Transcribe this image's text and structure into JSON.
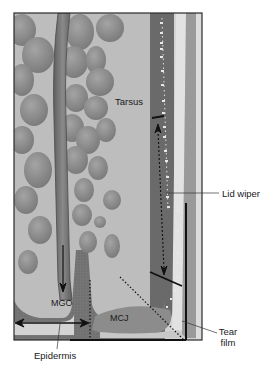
{
  "figure": {
    "type": "anatomical-diagram",
    "colors": {
      "background": "#ffffff",
      "tarsus_fill": "#bdbdbd",
      "gland_fill": "#8e8e8e",
      "duct_fill": "#7a7a7a",
      "conjunctiva_fill": "#6e6e6e",
      "epithelium_light": "#d6d6d6",
      "tear_film": "#a8a8a8",
      "frame": "#2a2a2a",
      "line": "#111111"
    }
  },
  "labels": {
    "tarsus": "Tarsus",
    "lid_wiper": "Lid wiper",
    "mgo": "MGO",
    "mcj": "MCJ",
    "epidermis": "Epidermis",
    "tear_line1": "Tear",
    "tear_line2": "film"
  }
}
